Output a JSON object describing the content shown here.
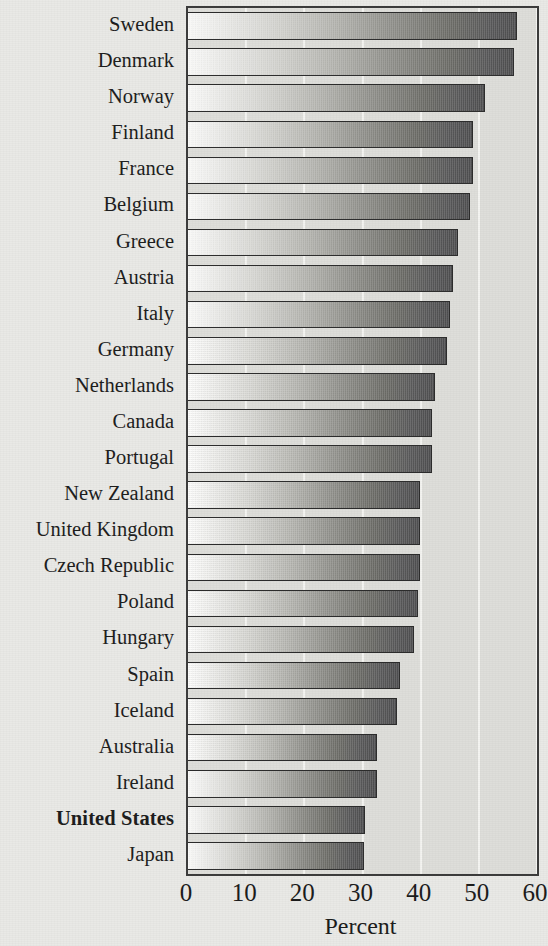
{
  "chart_data": {
    "type": "bar",
    "orientation": "horizontal",
    "title": "",
    "xlabel": "Percent",
    "ylabel": "",
    "xlim": [
      0,
      60
    ],
    "xticks": [
      0,
      10,
      20,
      30,
      40,
      50,
      60
    ],
    "xtick_labels": [
      "0",
      "10",
      "20",
      "30",
      "40",
      "50",
      "60"
    ],
    "grid": "vertical white gridlines at each tick",
    "legend": "none",
    "highlight": "United States",
    "categories": [
      "Sweden",
      "Denmark",
      "Norway",
      "Finland",
      "France",
      "Belgium",
      "Greece",
      "Austria",
      "Italy",
      "Germany",
      "Netherlands",
      "Canada",
      "Portugal",
      "New Zealand",
      "United Kingdom",
      "Czech Republic",
      "Poland",
      "Hungary",
      "Spain",
      "Iceland",
      "Australia",
      "Ireland",
      "United States",
      "Japan"
    ],
    "values": [
      56.5,
      56.0,
      51.0,
      49.0,
      49.0,
      48.5,
      46.5,
      45.5,
      45.0,
      44.5,
      42.5,
      42.0,
      42.0,
      39.8,
      39.8,
      39.8,
      39.5,
      38.8,
      36.5,
      36.0,
      32.5,
      32.5,
      30.5,
      30.3
    ],
    "bar_style": {
      "fill": "left-to-right white-to-dark-gray gradient",
      "edge_color": "#2b2b2b",
      "start_color": "#fdfdfc",
      "end_color": "#4e4e50"
    },
    "plot_background": "#dededa",
    "figure_background": "#e9e9e6",
    "axis_color": "#3a3a3a",
    "gridline_color": "#f4f4f1"
  }
}
